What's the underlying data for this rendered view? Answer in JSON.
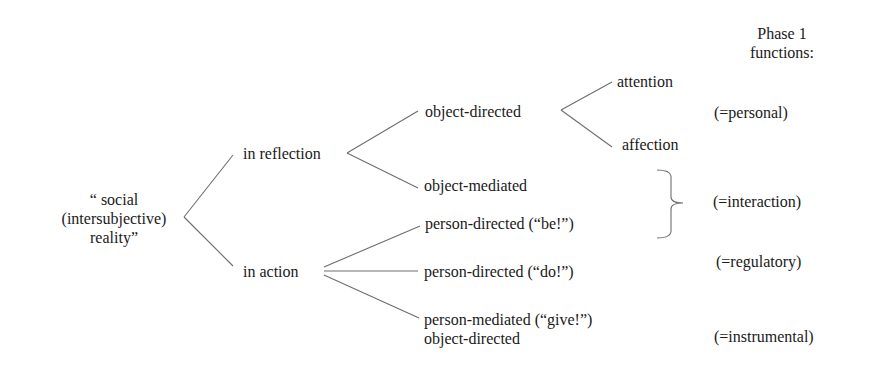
{
  "header": {
    "phase_title_line1": "Phase 1",
    "phase_title_line2": "functions:"
  },
  "root": {
    "line1": "“ social",
    "line2": "(intersubjective)",
    "line3": "reality”"
  },
  "level1": {
    "reflection": "in reflection",
    "action": "in action"
  },
  "level2": {
    "object_directed": "object-directed",
    "object_mediated": "object-mediated",
    "person_directed_be": "person-directed (“be!”)",
    "person_directed_do": "person-directed (“do!”)",
    "person_mediated_give": "person-mediated (“give!”)",
    "person_mediated_give_line2": "object-directed"
  },
  "level3": {
    "attention": "attention",
    "affection": "affection"
  },
  "functions": {
    "personal": "(=personal)",
    "interaction": "(=interaction)",
    "regulatory": "(=regulatory)",
    "instrumental": "(=instrumental)"
  },
  "colors": {
    "text": "#1a1a1a",
    "lines": "#6e6e6e",
    "background": "#ffffff"
  }
}
